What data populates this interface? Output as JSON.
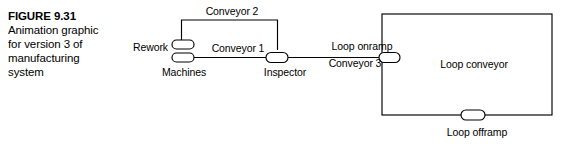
{
  "figure": {
    "number_label": "FIGURE 9.31",
    "caption_lines": [
      "Animation graphic",
      "for version 3 of",
      "manufacturing",
      "system"
    ]
  },
  "diagram": {
    "title": "Animation graphic for version 3 of manufacturing system",
    "nodes": [
      {
        "id": "rework",
        "label": "Rework",
        "kind": "text-label"
      },
      {
        "id": "machines",
        "label": "Machines",
        "kind": "double-capsule"
      },
      {
        "id": "inspector",
        "label": "Inspector",
        "kind": "capsule"
      },
      {
        "id": "loop-onramp",
        "label": "Loop onramp",
        "kind": "capsule"
      },
      {
        "id": "loop-offramp",
        "label": "Loop offramp",
        "kind": "capsule"
      },
      {
        "id": "loop-conveyor",
        "label": "Loop conveyor",
        "kind": "rectangle"
      }
    ],
    "links": [
      {
        "id": "conveyor-1",
        "label": "Conveyor 1",
        "from": "machines",
        "to": "inspector"
      },
      {
        "id": "conveyor-2",
        "label": "Conveyor 2",
        "from": "inspector",
        "to": "machines"
      },
      {
        "id": "conveyor-3",
        "label": "Conveyor 3",
        "from": "inspector",
        "to": "loop-onramp"
      }
    ],
    "labels": {
      "rework": "Rework",
      "machines": "Machines",
      "conveyor_1": "Conveyor 1",
      "conveyor_2": "Conveyor 2",
      "conveyor_3": "Conveyor 3",
      "inspector": "Inspector",
      "loop_onramp": "Loop onramp",
      "loop_conveyor": "Loop conveyor",
      "loop_offramp": "Loop offramp"
    },
    "colors": {
      "stroke": "#000000",
      "fill": "#ffffff",
      "background": "#ffffff"
    }
  }
}
